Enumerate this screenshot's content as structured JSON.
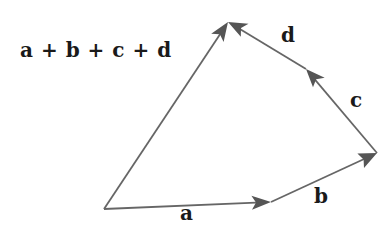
{
  "diagram": {
    "colors": {
      "line": "#666666",
      "arrowhead": "#555555",
      "label": "#1a1a1a",
      "background": "#ffffff"
    },
    "points": {
      "O": [
        104,
        209
      ],
      "A": [
        271,
        202
      ],
      "B": [
        377,
        153
      ],
      "C": [
        306,
        69
      ],
      "D": [
        228,
        22
      ]
    },
    "vectors": [
      {
        "id": "a",
        "label": "a",
        "from": "O",
        "to": "A",
        "label_pos": [
          180,
          205
        ]
      },
      {
        "id": "b",
        "label": "b",
        "from": "A",
        "to": "B",
        "label_pos": [
          314,
          188
        ]
      },
      {
        "id": "c",
        "label": "c",
        "from": "B",
        "to": "C",
        "label_pos": [
          350,
          92
        ]
      },
      {
        "id": "d",
        "label": "d",
        "from": "C",
        "to": "D",
        "label_pos": [
          281,
          27
        ]
      },
      {
        "id": "sum",
        "label": "a + b + c + d",
        "from": "O",
        "to": "D",
        "label_pos": [
          20,
          40
        ]
      }
    ]
  }
}
